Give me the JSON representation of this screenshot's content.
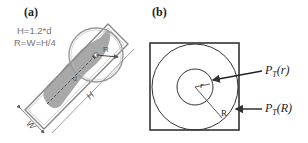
{
  "panel_a": {
    "label": "(a)",
    "formula_line1": "H=1.2*d",
    "formula_line2": "R=W=H/4",
    "dim_width": "W",
    "dim_height": "H",
    "radius_label": "R",
    "center_label": "d"
  },
  "panel_b": {
    "label": "(b)",
    "inner_radius_label": "r",
    "outer_radius_label": "R",
    "annotation_inner": "P_T(r)",
    "annotation_outer": "P_T(R)"
  }
}
